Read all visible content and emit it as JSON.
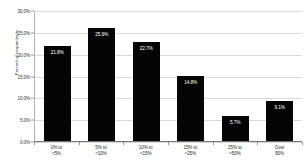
{
  "chart_data": {
    "type": "bar",
    "title": "",
    "xlabel": "",
    "ylabel": "Percent of respondents",
    "categories": [
      "0% to <5%",
      "5% to <10%",
      "10% to <15%",
      "15% to <25%",
      "25% to <50%",
      "Over 50%"
    ],
    "category_lines": [
      [
        "0% to",
        "<5%"
      ],
      [
        "5% to",
        "<10%"
      ],
      [
        "10% to",
        "<15%"
      ],
      [
        "15% to",
        "<25%"
      ],
      [
        "25% to",
        "<50%"
      ],
      [
        "Over",
        "50%"
      ]
    ],
    "values": [
      21.8,
      25.9,
      22.7,
      14.8,
      5.7,
      9.1
    ],
    "value_labels": [
      "21.8%",
      "25.9%",
      "22.7%",
      "14.8%",
      "5.7%",
      "9.1%"
    ],
    "ylim": [
      0,
      30
    ],
    "yticks": [
      0,
      5,
      10,
      15,
      20,
      25,
      30
    ],
    "ytick_labels": [
      "0.0%",
      "5.0%",
      "10.0%",
      "15.0%",
      "20.0%",
      "25.0%",
      "30.0%"
    ],
    "grid": true,
    "legend": null,
    "bar_color": "#050505",
    "grid_color": "#d9d9d9",
    "value_label_color": "#ffffff"
  },
  "cropped_title": "•"
}
